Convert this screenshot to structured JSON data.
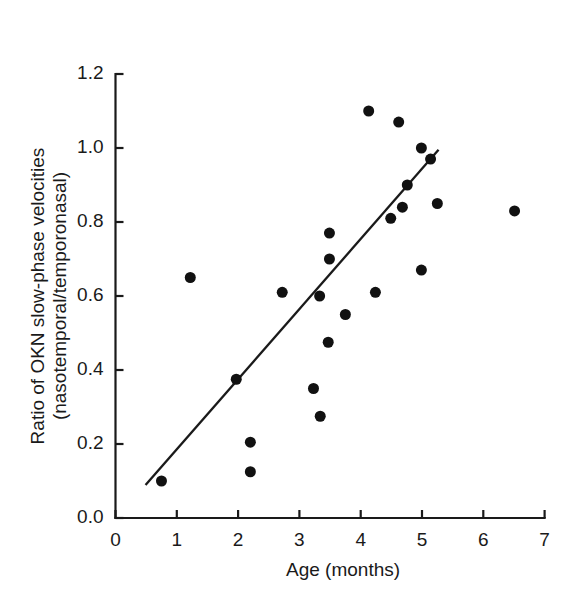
{
  "chart_data": {
    "type": "scatter",
    "title": "",
    "xlabel": "Age (months)",
    "ylabel_line1": "Ratio of OKN slow-phase velocities",
    "ylabel_line2": "(nasotemporal/temporonasal)",
    "xlim": [
      0,
      7
    ],
    "ylim": [
      0.0,
      1.2
    ],
    "xticks": [
      0,
      1,
      2,
      3,
      4,
      5,
      6,
      7
    ],
    "xtick_labels": [
      "0",
      "1",
      "2",
      "3",
      "4",
      "5",
      "6",
      "7"
    ],
    "yticks": [
      0.0,
      0.2,
      0.4,
      0.6,
      0.8,
      1.0,
      1.2
    ],
    "ytick_labels": [
      "0.0",
      "0.2",
      "0.4",
      "0.6",
      "0.8",
      "1.0",
      "1.2"
    ],
    "grid": false,
    "legend": false,
    "marker": "filled-circle",
    "marker_color": "#111111",
    "marker_size_px": 11,
    "points": [
      {
        "x": 0.75,
        "y": 0.1
      },
      {
        "x": 1.22,
        "y": 0.65
      },
      {
        "x": 1.97,
        "y": 0.375
      },
      {
        "x": 2.2,
        "y": 0.205
      },
      {
        "x": 2.2,
        "y": 0.125
      },
      {
        "x": 2.72,
        "y": 0.61
      },
      {
        "x": 3.23,
        "y": 0.35
      },
      {
        "x": 3.33,
        "y": 0.6
      },
      {
        "x": 3.34,
        "y": 0.275
      },
      {
        "x": 3.47,
        "y": 0.475
      },
      {
        "x": 3.49,
        "y": 0.77
      },
      {
        "x": 3.49,
        "y": 0.7
      },
      {
        "x": 3.75,
        "y": 0.55
      },
      {
        "x": 4.13,
        "y": 1.1
      },
      {
        "x": 4.24,
        "y": 0.61
      },
      {
        "x": 4.49,
        "y": 0.81
      },
      {
        "x": 4.62,
        "y": 1.07
      },
      {
        "x": 4.68,
        "y": 0.84
      },
      {
        "x": 4.76,
        "y": 0.9
      },
      {
        "x": 4.99,
        "y": 1.0
      },
      {
        "x": 4.99,
        "y": 0.67
      },
      {
        "x": 5.14,
        "y": 0.97
      },
      {
        "x": 5.25,
        "y": 0.85
      },
      {
        "x": 6.51,
        "y": 0.83
      }
    ],
    "trend_line": {
      "x_start": 0.49,
      "y_start": 0.089,
      "x_end": 5.27,
      "y_end": 0.995,
      "color": "#1a1a1a"
    },
    "axis_color": "#1a1a1a",
    "background": "#ffffff"
  }
}
